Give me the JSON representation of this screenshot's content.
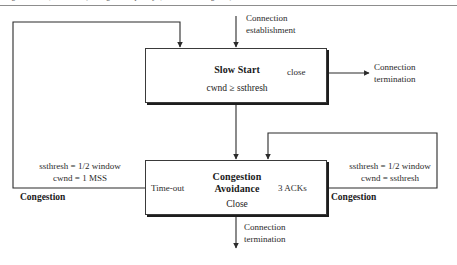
{
  "figure": {
    "caption": "Figure 24.8 (continued) Congestion policy  (transition diagram)"
  },
  "diagram": {
    "type": "state-transition-diagram",
    "states": [
      {
        "id": "slow-start",
        "name": "Slow Start",
        "condition": "cwnd ≥ ssthresh",
        "x": 145,
        "y": 48,
        "width": 182,
        "height": 55
      },
      {
        "id": "congestion-avoidance",
        "name": "Congestion\nAvoidance",
        "name_line1": "Congestion",
        "name_line2": "Avoidance",
        "condition": "Close",
        "x": 145,
        "y": 160,
        "width": 182,
        "height": 55
      }
    ],
    "labels": {
      "connection_establishment_l1": "Connection",
      "connection_establishment_l2": "establishment",
      "connection_termination_right_l1": "Connection",
      "connection_termination_right_l2": "termination",
      "connection_termination_bottom_l1": "Connection",
      "connection_termination_bottom_l2": "termination",
      "close_transition": "close",
      "timeout_transition": "Time-out",
      "three_acks_transition": "3 ACKs",
      "left_action_l1": "ssthresh = 1/2 window",
      "left_action_l2": "cwnd = 1 MSS",
      "left_event": "Congestion",
      "right_action_l1": "ssthresh = 1/2 window",
      "right_action_l2": "cwnd = ssthresh",
      "right_event": "Congestion"
    },
    "colors": {
      "line": "#2b2b2b",
      "box_border": "#3a3a3a",
      "box_shadow": "#1d1d1d",
      "text": "#1a1a1a",
      "rule": "#8d8d8d",
      "background": "#ffffff"
    }
  }
}
